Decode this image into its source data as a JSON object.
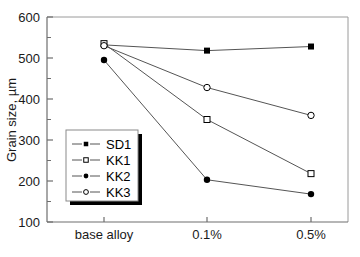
{
  "chart_data": {
    "type": "line",
    "title": "",
    "xlabel": "",
    "ylabel": "Grain size, µm",
    "categories": [
      "base alloy",
      "0.1%",
      "0.5%"
    ],
    "ylim": [
      100,
      600
    ],
    "yticks": [
      100,
      200,
      300,
      400,
      500,
      600
    ],
    "yticklabels": [
      "100",
      "200",
      "300",
      "400",
      "500",
      "600"
    ],
    "yminorticks": [
      150,
      250,
      350,
      450,
      550
    ],
    "grid": false,
    "legend_position": "center-left",
    "series": [
      {
        "name": "SD1",
        "marker": "filled-square",
        "values": [
          532,
          518,
          528
        ]
      },
      {
        "name": "KK1",
        "marker": "open-square",
        "values": [
          535,
          350,
          218
        ]
      },
      {
        "name": "KK2",
        "marker": "filled-circle",
        "values": [
          495,
          203,
          168
        ]
      },
      {
        "name": "KK3",
        "marker": "open-circle",
        "values": [
          530,
          428,
          360
        ]
      }
    ],
    "line_color": "#555555",
    "marker_color": "#000000",
    "axis_color": "#808080",
    "background": "#ffffff"
  },
  "legend": {
    "items": [
      {
        "label": "SD1"
      },
      {
        "label": "KK1"
      },
      {
        "label": "KK2"
      },
      {
        "label": "KK3"
      }
    ]
  },
  "axes": {
    "y_title": "Grain size, µm",
    "y_tick_labels": [
      "600",
      "500",
      "400",
      "300",
      "200",
      "100"
    ],
    "x_tick_labels": [
      "base alloy",
      "0.1%",
      "0.5%"
    ]
  }
}
